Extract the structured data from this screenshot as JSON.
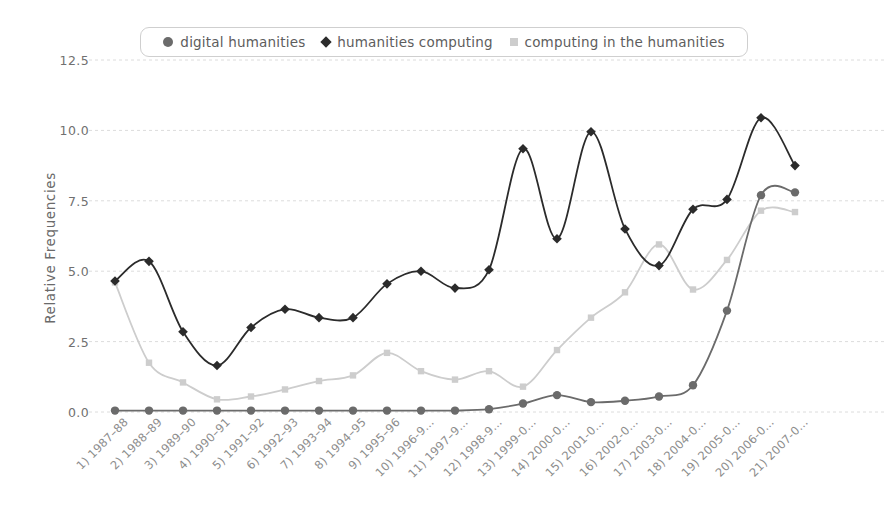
{
  "chart_data": {
    "type": "line",
    "title": "",
    "xlabel": "",
    "ylabel": "Relative Frequencies",
    "ylim": [
      0.0,
      12.5
    ],
    "yticks": [
      "0.0",
      "2.5",
      "5.0",
      "7.5",
      "10.0",
      "12.5"
    ],
    "ytick_values": [
      0.0,
      2.5,
      5.0,
      7.5,
      10.0,
      12.5
    ],
    "grid": true,
    "legend_position": "top",
    "categories": [
      "1) 1987–88",
      "2) 1988–89",
      "3) 1989–90",
      "4) 1990–91",
      "5) 1991–92",
      "6) 1992–93",
      "7) 1993–94",
      "8) 1994–95",
      "9) 1995–96",
      "10) 1996-9…",
      "11) 1997–9…",
      "12) 1998-9…",
      "13) 1999-0…",
      "14) 2000-0…",
      "15) 2001-0…",
      "16) 2002-0…",
      "17) 2003-0…",
      "18) 2004-0…",
      "19) 2005-0…",
      "20) 2006-0…",
      "21) 2007-0…"
    ],
    "series": [
      {
        "name": "digital humanities",
        "color": "#6b6b6b",
        "marker": "circle",
        "values": [
          0.05,
          0.05,
          0.05,
          0.05,
          0.05,
          0.05,
          0.05,
          0.05,
          0.05,
          0.05,
          0.05,
          0.1,
          0.3,
          0.6,
          0.35,
          0.4,
          0.55,
          0.95,
          3.6,
          7.7,
          7.8
        ]
      },
      {
        "name": "humanities computing",
        "color": "#2b2b2b",
        "marker": "diamond",
        "values": [
          4.65,
          5.35,
          2.85,
          1.65,
          3.0,
          3.65,
          3.35,
          3.35,
          4.55,
          5.0,
          4.4,
          5.05,
          9.35,
          6.15,
          9.95,
          6.5,
          5.2,
          7.2,
          7.55,
          10.45,
          8.75
        ]
      },
      {
        "name": "computing in the humanities",
        "color": "#cdcdcd",
        "marker": "square",
        "values": [
          4.6,
          1.75,
          1.05,
          0.45,
          0.55,
          0.8,
          1.1,
          1.3,
          2.1,
          1.45,
          1.15,
          1.45,
          0.9,
          2.2,
          3.35,
          4.25,
          5.95,
          4.35,
          5.4,
          7.15,
          7.1
        ]
      }
    ]
  },
  "legend": {
    "items": [
      {
        "label": "digital humanities",
        "marker": "circle-marker"
      },
      {
        "label": "humanities computing",
        "marker": "diamond-marker"
      },
      {
        "label": "computing in the humanities",
        "marker": "square-marker"
      }
    ]
  }
}
